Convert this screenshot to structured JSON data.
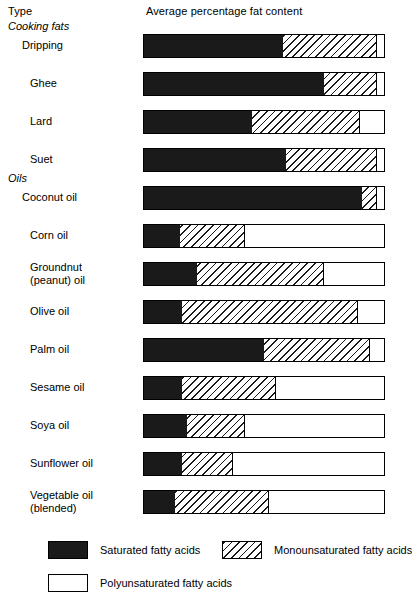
{
  "header": {
    "type_label": "Type",
    "value_label": "Average percentage fat content"
  },
  "chart_data": {
    "type": "bar",
    "orientation": "horizontal",
    "stacked": true,
    "title": "Average percentage fat content",
    "xlabel": "",
    "ylabel": "Type",
    "xlim": [
      0,
      100
    ],
    "grid": false,
    "legend_position": "bottom",
    "units": "percent",
    "group_headings": [
      "Cooking fats",
      "Oils"
    ],
    "categories": [
      "Dripping",
      "Ghee",
      "Lard",
      "Suet",
      "Coconut oil",
      "Corn oil",
      "Groundnut (peanut) oil",
      "Olive oil",
      "Palm oil",
      "Sesame oil",
      "Soya oil",
      "Sunflower oil",
      "Vegetable oil (blended)"
    ],
    "series": [
      {
        "name": "Saturated fatty acids",
        "values": [
          58,
          75,
          45,
          59,
          91,
          15,
          22,
          16,
          50,
          16,
          18,
          16,
          13
        ]
      },
      {
        "name": "Monounsaturated fatty acids",
        "values": [
          39,
          22,
          45,
          38,
          6,
          27,
          53,
          73,
          44,
          39,
          24,
          21,
          39
        ]
      },
      {
        "name": "Polyunsaturated fatty acids",
        "values": [
          3,
          3,
          10,
          3,
          3,
          58,
          25,
          11,
          6,
          45,
          58,
          63,
          48
        ]
      }
    ]
  },
  "rows": [
    {
      "label": "Dripping",
      "group": "Cooking fats",
      "indent": true,
      "lines": [
        "Dripping"
      ],
      "sat": 58,
      "mono": 39,
      "poly": 3
    },
    {
      "label": "Ghee",
      "group": null,
      "indent": false,
      "lines": [
        "Ghee"
      ],
      "sat": 75,
      "mono": 22,
      "poly": 3
    },
    {
      "label": "Lard",
      "group": null,
      "indent": false,
      "lines": [
        "Lard"
      ],
      "sat": 45,
      "mono": 45,
      "poly": 10
    },
    {
      "label": "Suet",
      "group": null,
      "indent": false,
      "lines": [
        "Suet"
      ],
      "sat": 59,
      "mono": 38,
      "poly": 3
    },
    {
      "label": "Coconut oil",
      "group": "Oils",
      "indent": true,
      "lines": [
        "Coconut oil"
      ],
      "sat": 91,
      "mono": 6,
      "poly": 3
    },
    {
      "label": "Corn oil",
      "group": null,
      "indent": false,
      "lines": [
        "Corn oil"
      ],
      "sat": 15,
      "mono": 27,
      "poly": 58
    },
    {
      "label": "Groundnut (peanut) oil",
      "group": null,
      "indent": false,
      "lines": [
        "Groundnut",
        "(peanut) oil"
      ],
      "sat": 22,
      "mono": 53,
      "poly": 25
    },
    {
      "label": "Olive oil",
      "group": null,
      "indent": false,
      "lines": [
        "Olive oil"
      ],
      "sat": 16,
      "mono": 73,
      "poly": 11
    },
    {
      "label": "Palm oil",
      "group": null,
      "indent": false,
      "lines": [
        "Palm oil"
      ],
      "sat": 50,
      "mono": 44,
      "poly": 6
    },
    {
      "label": "Sesame oil",
      "group": null,
      "indent": false,
      "lines": [
        "Sesame oil"
      ],
      "sat": 16,
      "mono": 39,
      "poly": 45
    },
    {
      "label": "Soya oil",
      "group": null,
      "indent": false,
      "lines": [
        "Soya oil"
      ],
      "sat": 18,
      "mono": 24,
      "poly": 58
    },
    {
      "label": "Sunflower oil",
      "group": null,
      "indent": false,
      "lines": [
        "Sunflower oil"
      ],
      "sat": 16,
      "mono": 21,
      "poly": 63
    },
    {
      "label": "Vegetable oil (blended)",
      "group": null,
      "indent": false,
      "lines": [
        "Vegetable oil",
        "(blended)"
      ],
      "sat": 13,
      "mono": 39,
      "poly": 48
    }
  ],
  "legend": {
    "items": [
      {
        "key": "sat",
        "label": "Saturated fatty acids"
      },
      {
        "key": "mono",
        "label": "Monounsaturated fatty acids"
      },
      {
        "key": "poly",
        "label": "Polyunsaturated fatty acids"
      }
    ]
  },
  "colors": {
    "saturated": "#1a1a1a",
    "monounsaturated_hatch": "#1a1a1a",
    "monounsaturated_ground": "#ffffff",
    "polyunsaturated": "#ffffff",
    "outline": "#000000",
    "background": "#ffffff",
    "text": "#000000"
  }
}
